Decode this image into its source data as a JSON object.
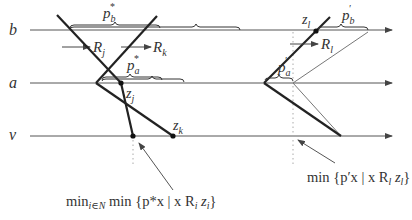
{
  "axes": {
    "b": {
      "label": "b",
      "y": 30
    },
    "a": {
      "label": "a",
      "y": 83
    },
    "v": {
      "label": "v",
      "y": 136
    }
  },
  "left_labels": {
    "pb_star": "p",
    "pb_star_sub": "b",
    "pb_star_sup": "*",
    "pa_star": "p",
    "pa_star_sub": "a",
    "pa_star_sup": "*",
    "Rj": "R",
    "Rj_sub": "j",
    "Rk": "R",
    "Rk_sub": "k",
    "zj": "z",
    "zj_sub": "j",
    "zk": "z",
    "zk_sub": "k"
  },
  "right_labels": {
    "pb_prime": "p",
    "pb_prime_sub": "b",
    "pb_prime_sup": "′",
    "pa_prime": "p",
    "pa_prime_sub": "a",
    "pa_prime_sup": "′",
    "Rl": "R",
    "Rl_sub": "l",
    "zl": "z",
    "zl_sub": "l"
  },
  "formulas": {
    "left": {
      "min1": "min",
      "sub": "i∈N",
      "rest": " min {p*x | x R",
      "r_sub": "i",
      "z": " z",
      "z_sub": "i",
      "close": "}"
    },
    "right": {
      "text": "min {p′x | x R",
      "r_sub": "l",
      "z": " z",
      "z_sub": "l",
      "close": "}"
    }
  },
  "colors": {
    "line": "#555555",
    "thick": "#222222",
    "thin": "#777777",
    "dotted": "#aaaaaa"
  }
}
